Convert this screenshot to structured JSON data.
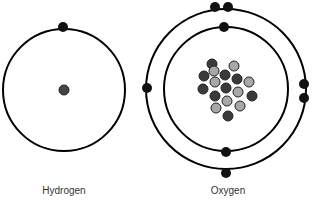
{
  "atoms": [
    {
      "name": "Hydrogen",
      "label": "Hydrogen",
      "center": [
        64,
        90
      ],
      "nucleus": {
        "protons": 1,
        "neutrons": 0
      },
      "shells": [
        {
          "radius": 61,
          "electrons": [
            [
              63,
              27
            ]
          ]
        }
      ]
    },
    {
      "name": "Oxygen",
      "label": "Oxygen",
      "center": [
        226,
        89
      ],
      "nucleus": {
        "protons": 8,
        "neutrons": 8
      },
      "shells": [
        {
          "radius": 62,
          "electrons": [
            [
              224,
              27
            ],
            [
              226,
              152
            ]
          ]
        },
        {
          "radius": 80,
          "electrons": [
            [
              215,
              6
            ],
            [
              228,
              6
            ],
            [
              147,
              88
            ],
            [
              304,
              84
            ],
            [
              304,
              98
            ],
            [
              226,
              174
            ]
          ]
        }
      ]
    }
  ],
  "colors": {
    "line": "#000000",
    "electron": "#111111",
    "proton_dark": "#3a3a3a",
    "neutron_light": "#a8a8a8",
    "label": "#333333"
  },
  "legend": {
    "dark_particle": "proton",
    "light_particle": "neutron"
  }
}
